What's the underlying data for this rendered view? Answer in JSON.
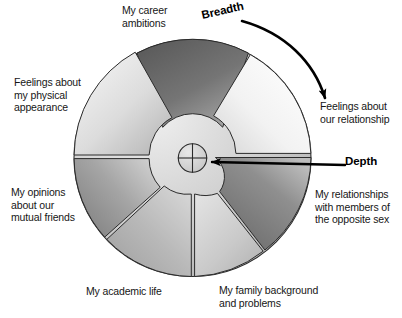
{
  "figure": {
    "type": "social-penetration-onion-diagram",
    "title": "",
    "center_marker": "crosshair-target"
  },
  "callouts": [
    {
      "id": "breadth",
      "label": "Breadth",
      "arrow": "curved-arc-clockwise-top-right"
    },
    {
      "id": "depth",
      "label": "Depth",
      "arrow": "straight-left-pointing-radial"
    }
  ],
  "callout_breadth": {
    "label": "Breadth"
  },
  "callout_depth": {
    "label": "Depth"
  },
  "segments": [
    {
      "id": "career",
      "label": "My career\nambitions",
      "position": "top",
      "start_angle": -62,
      "end_angle": -118,
      "inner_radius": 30,
      "outer_radius": 118,
      "shade": "dark",
      "fill_from": "#5e5e5e",
      "fill_to": "#a9a9a9"
    },
    {
      "id": "relationship",
      "label": "Feelings about\nour relationship",
      "position": "upper-right",
      "start_angle": -56,
      "end_angle": 2,
      "inner_radius": 60,
      "outer_radius": 118,
      "shade": "very-light",
      "fill_from": "#ffffff",
      "fill_to": "#e3e3e3"
    },
    {
      "id": "opposite-sex",
      "label": "My relationships\nwith members of\nthe opposite sex",
      "position": "right-lower",
      "start_angle": 3,
      "end_angle": 62,
      "inner_radius": 22,
      "outer_radius": 118,
      "shade": "dark",
      "fill_from": "#6f6f6f",
      "fill_to": "#b5b5b5"
    },
    {
      "id": "family",
      "label": "My family background\nand problems",
      "position": "bottom-right",
      "start_angle": 64,
      "end_angle": 90,
      "inner_radius": 30,
      "outer_radius": 118,
      "shade": "medium-light",
      "fill_from": "#d8d8d8",
      "fill_to": "#bdbdbd"
    },
    {
      "id": "academic",
      "label": "My academic life",
      "position": "bottom-left",
      "start_angle": 91,
      "end_angle": 140,
      "inner_radius": 30,
      "outer_radius": 118,
      "shade": "medium",
      "fill_from": "#adadad",
      "fill_to": "#cfcfcf"
    },
    {
      "id": "mutual-friends",
      "label": "My opinions\nabout our\nmutual friends",
      "position": "left-lower",
      "start_angle": 142,
      "end_angle": 180,
      "inner_radius": 62,
      "outer_radius": 118,
      "shade": "medium-dark",
      "fill_from": "#8c8c8c",
      "fill_to": "#c8c8c8"
    },
    {
      "id": "physical-appearance",
      "label": "Feelings about\nmy physical\nappearance",
      "position": "upper-left",
      "start_angle": 182,
      "end_angle": 242,
      "inner_radius": 60,
      "outer_radius": 118,
      "shade": "light",
      "fill_from": "#efefef",
      "fill_to": "#c4c4c4"
    }
  ],
  "core": {
    "label": "",
    "fill_from": "#ededed",
    "fill_to": "#b8b8b8"
  },
  "colors": {
    "outline": "#2b2b2b",
    "text": "#161616",
    "background": "#ffffff",
    "arrow": "#000000"
  }
}
